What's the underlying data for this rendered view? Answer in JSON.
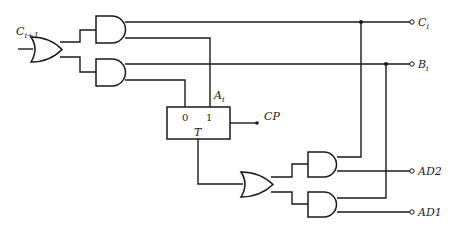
{
  "diagram": {
    "type": "logic-circuit",
    "signals": {
      "carry_in": {
        "main": "C",
        "sub": "i+1"
      },
      "carry_out": {
        "main": "C",
        "sub": "i"
      },
      "borrow_out": {
        "main": "B",
        "sub": "i"
      },
      "flipflop_out": {
        "main": "A",
        "sub": "i"
      },
      "clock": "CP",
      "ad2": "AD2",
      "ad1": "AD1"
    },
    "flipflop": {
      "type_label": "T",
      "pin0": "0",
      "pin1": "1"
    },
    "gates": [
      {
        "id": "or-left",
        "type": "OR"
      },
      {
        "id": "and-upper",
        "type": "AND"
      },
      {
        "id": "and-lower",
        "type": "AND"
      },
      {
        "id": "or-bottom",
        "type": "OR"
      },
      {
        "id": "and-ad2",
        "type": "AND"
      },
      {
        "id": "and-ad1",
        "type": "AND"
      }
    ],
    "colors": {
      "line": "#1a1a1a",
      "background": "#ffffff"
    }
  }
}
